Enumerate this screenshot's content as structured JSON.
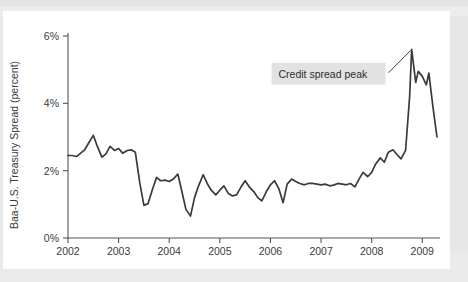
{
  "figure": {
    "background_color": "#e7e7e7",
    "card_color": "#ffffff",
    "line_color": "#3a3a3a",
    "axis_color": "#555555",
    "annotation_highlight_color": "#e2e2e2"
  },
  "annotation": {
    "label": "Credit spread peak"
  },
  "axes": {
    "y_title": "Baa-U.S. Treasury Spread (percent)",
    "y_ticks": [
      "0%",
      "2%",
      "4%",
      "6%"
    ],
    "x_ticks": [
      "2002",
      "2003",
      "2004",
      "2005",
      "2006",
      "2007",
      "2008",
      "2009"
    ]
  },
  "chart_data": {
    "type": "line",
    "title": "",
    "subtitle": "",
    "xlabel": "",
    "ylabel": "Baa-U.S. Treasury Spread (percent)",
    "xlim": [
      2002.0,
      2009.35
    ],
    "ylim": [
      0,
      6
    ],
    "ytick_values": [
      0,
      2,
      4,
      6
    ],
    "ytick_labels": [
      "0%",
      "2%",
      "4%",
      "6%"
    ],
    "xtick_values": [
      2002,
      2003,
      2004,
      2005,
      2006,
      2007,
      2008,
      2009
    ],
    "xtick_labels": [
      "2002",
      "2003",
      "2004",
      "2005",
      "2006",
      "2007",
      "2008",
      "2009"
    ],
    "grid": false,
    "legend": null,
    "units": "percent",
    "annotations": [
      {
        "text": "Credit spread peak",
        "points_to_x": 2008.79,
        "points_to_y": 5.6,
        "text_x": 2006.1,
        "text_y": 4.85,
        "highlight": true
      }
    ],
    "series": [
      {
        "name": "Baa-U.S. Treasury Spread",
        "color": "#3a3a3a",
        "x": [
          2002.0,
          2002.08,
          2002.17,
          2002.25,
          2002.33,
          2002.42,
          2002.5,
          2002.58,
          2002.67,
          2002.75,
          2002.83,
          2002.92,
          2003.0,
          2003.08,
          2003.17,
          2003.25,
          2003.33,
          2003.42,
          2003.5,
          2003.58,
          2003.67,
          2003.75,
          2003.83,
          2003.92,
          2004.0,
          2004.08,
          2004.17,
          2004.25,
          2004.33,
          2004.42,
          2004.5,
          2004.58,
          2004.67,
          2004.75,
          2004.83,
          2004.92,
          2005.0,
          2005.08,
          2005.17,
          2005.25,
          2005.33,
          2005.42,
          2005.5,
          2005.58,
          2005.67,
          2005.75,
          2005.83,
          2005.92,
          2006.0,
          2006.08,
          2006.17,
          2006.25,
          2006.33,
          2006.42,
          2006.5,
          2006.58,
          2006.67,
          2006.75,
          2006.83,
          2006.92,
          2007.0,
          2007.08,
          2007.17,
          2007.25,
          2007.33,
          2007.42,
          2007.5,
          2007.58,
          2007.67,
          2007.75,
          2007.83,
          2007.92,
          2008.0,
          2008.08,
          2008.17,
          2008.25,
          2008.33,
          2008.42,
          2008.5,
          2008.58,
          2008.67,
          2008.75,
          2008.79,
          2008.87,
          2008.92,
          2009.0,
          2009.08,
          2009.13,
          2009.21,
          2009.29
        ],
        "y": [
          2.45,
          2.45,
          2.42,
          2.52,
          2.62,
          2.85,
          3.05,
          2.72,
          2.4,
          2.5,
          2.72,
          2.6,
          2.66,
          2.52,
          2.6,
          2.62,
          2.55,
          1.62,
          0.97,
          1.02,
          1.45,
          1.8,
          1.7,
          1.72,
          1.68,
          1.75,
          1.9,
          1.38,
          0.85,
          0.65,
          1.2,
          1.55,
          1.88,
          1.62,
          1.42,
          1.28,
          1.42,
          1.55,
          1.32,
          1.25,
          1.28,
          1.52,
          1.7,
          1.52,
          1.38,
          1.2,
          1.1,
          1.38,
          1.58,
          1.7,
          1.45,
          1.05,
          1.6,
          1.75,
          1.68,
          1.62,
          1.58,
          1.62,
          1.62,
          1.6,
          1.58,
          1.6,
          1.55,
          1.57,
          1.62,
          1.6,
          1.58,
          1.62,
          1.52,
          1.75,
          1.95,
          1.82,
          1.95,
          2.2,
          2.38,
          2.25,
          2.55,
          2.62,
          2.48,
          2.35,
          2.6,
          4.2,
          5.6,
          4.62,
          4.95,
          4.8,
          4.55,
          4.9,
          3.9,
          3.0
        ]
      }
    ]
  }
}
